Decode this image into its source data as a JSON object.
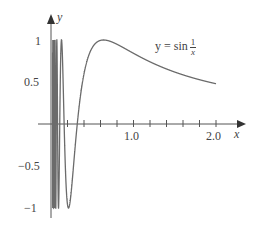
{
  "chart_data": {
    "type": "line",
    "title": "",
    "function": "y = sin(1/x)",
    "annotation": {
      "prefix": "y = sin",
      "numerator": "1",
      "denominator": "x"
    },
    "xlabel": "x",
    "ylabel": "y",
    "x_ticks": [
      0.2,
      0.4,
      0.6,
      0.8,
      1.0,
      1.2,
      1.4,
      1.6,
      1.8,
      2.0
    ],
    "x_tick_labels": [
      "1.0",
      "2.0"
    ],
    "y_tick_labels": [
      "1",
      "0.5",
      "-0.5",
      "-1"
    ],
    "xlim": [
      0,
      2.1
    ],
    "ylim": [
      -1,
      1
    ],
    "grid": false,
    "series": [
      {
        "name": "sin(1/x)",
        "x": [
          0.212,
          0.318,
          0.637,
          1.0,
          1.5,
          2.0
        ],
        "values": [
          -1,
          0,
          1,
          0.841,
          0.618,
          0.479
        ]
      }
    ],
    "colors": {
      "curve": "#6b6b6b",
      "axis": "#555555",
      "text": "#444444"
    }
  },
  "labels": {
    "y_axis": "y",
    "x_axis": "x",
    "y1": "1",
    "y05": "0.5",
    "ym05": "−0.5",
    "ym1": "−1",
    "x1": "1.0",
    "x2": "2.0",
    "eq_prefix": "y = sin",
    "eq_num": "1",
    "eq_den": "x"
  }
}
